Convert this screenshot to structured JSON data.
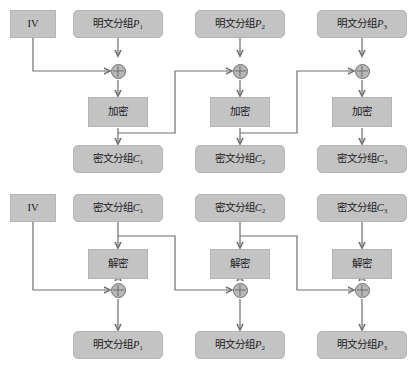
{
  "diagram": {
    "iv_label": "IV",
    "encrypt_label": "加密",
    "decrypt_label": "解密",
    "plaintext_prefix": "明文分组",
    "ciphertext_prefix": "密文分组",
    "plaintext_var": "P",
    "ciphertext_var": "C",
    "colors": {
      "node_fill": "#c3c3c3",
      "node_border": "#b4b4b4",
      "wire": "#6e6e6e",
      "xor_fill": "#b8b8b8",
      "background": "#ffffff",
      "text": "#1a1a1a"
    },
    "encryption": {
      "iv": "IV",
      "columns": [
        {
          "input": "明文分组",
          "input_var": "P",
          "input_sub": "1",
          "operation": "加密",
          "output": "密文分组",
          "output_var": "C",
          "output_sub": "1"
        },
        {
          "input": "明文分组",
          "input_var": "P",
          "input_sub": "2",
          "operation": "加密",
          "output": "密文分组",
          "output_var": "C",
          "output_sub": "2"
        },
        {
          "input": "明文分组",
          "input_var": "P",
          "input_sub": "3",
          "operation": "加密",
          "output": "密文分组",
          "output_var": "C",
          "output_sub": "3"
        }
      ]
    },
    "decryption": {
      "iv": "IV",
      "columns": [
        {
          "input": "密文分组",
          "input_var": "C",
          "input_sub": "1",
          "operation": "解密",
          "output": "明文分组",
          "output_var": "P",
          "output_sub": "1"
        },
        {
          "input": "密文分组",
          "input_var": "C",
          "input_sub": "2",
          "operation": "解密",
          "output": "明文分组",
          "output_var": "P",
          "output_sub": "2"
        },
        {
          "input": "密文分组",
          "input_var": "C",
          "input_sub": "3",
          "operation": "解密",
          "output": "明文分组",
          "output_var": "P",
          "output_sub": "3"
        }
      ]
    }
  }
}
